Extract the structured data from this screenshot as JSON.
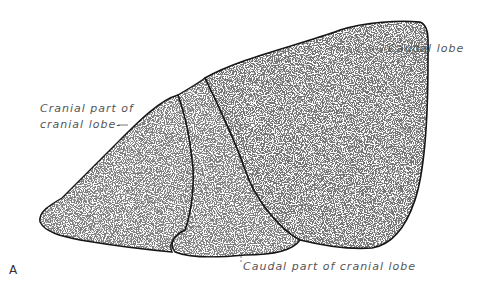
{
  "figure": {
    "panel_label": "A",
    "labels": {
      "caudal_lobe": "Caudal lobe",
      "cranial_part_line1": "Cranial part of",
      "cranial_part_line2": "cranial lobe-",
      "caudal_part_of_cranial": "Caudal part of cranial lobe"
    },
    "colors": {
      "ink": "#1a1a1a",
      "label": "#555555",
      "background": "#ffffff"
    }
  }
}
